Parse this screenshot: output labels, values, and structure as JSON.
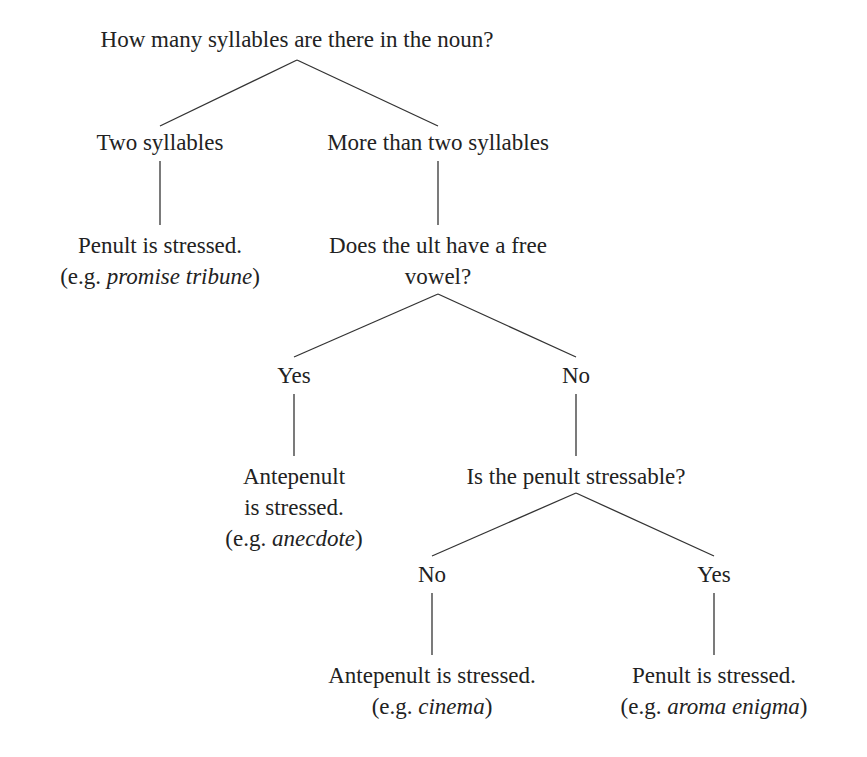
{
  "diagram": {
    "type": "decision-tree",
    "line_color": "#333333",
    "nodes": {
      "root": {
        "text": "How many syllables are there in the noun?"
      },
      "two": {
        "text": "Two syllables"
      },
      "more": {
        "text": "More than two syllables"
      },
      "two_result": {
        "line1": "Penult is stressed.",
        "eg_prefix": "(e.g. ",
        "eg_words": "promise tribune",
        "eg_suffix": ")"
      },
      "ult_q": {
        "line1": "Does the ult have a free",
        "line2": "vowel?"
      },
      "yes1": {
        "text": "Yes"
      },
      "no1": {
        "text": "No"
      },
      "yes1_result": {
        "line1": "Antepenult",
        "line2": "is stressed.",
        "eg_prefix": "(e.g. ",
        "eg_words": "anecdote",
        "eg_suffix": ")"
      },
      "penult_q": {
        "text": "Is the penult stressable?"
      },
      "no2": {
        "text": "No"
      },
      "yes2": {
        "text": "Yes"
      },
      "no2_result": {
        "line1": "Antepenult is stressed.",
        "eg_prefix": "(e.g. ",
        "eg_words": "cinema",
        "eg_suffix": ")"
      },
      "yes2_result": {
        "line1": "Penult is stressed.",
        "eg_prefix": "(e.g. ",
        "eg_words": "aroma enigma",
        "eg_suffix": ")"
      }
    }
  }
}
